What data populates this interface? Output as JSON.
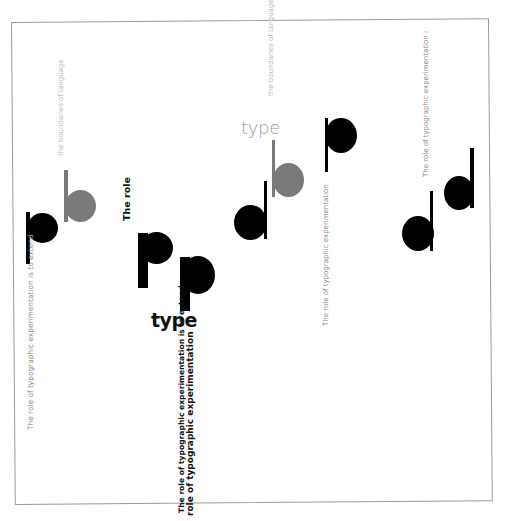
{
  "poster": {
    "texts": {
      "left_faint": "the boundaries of language",
      "left_vertical": "The role of typographic experimentation is to extend",
      "the_role_bold": "The role",
      "type_bold": "type",
      "bottom_line1": "The role of typographic experimentation is to extend",
      "bottom_line2": "role of typographic experimentation",
      "type_light": "type",
      "top_center_faint": "the boundaries of language",
      "mid_right_vertical": "The role of typographic experimentation",
      "right_vertical": "The role of typographic experimentation i"
    },
    "glyphs": [
      {
        "letter": "p",
        "color": "black",
        "position": "left"
      },
      {
        "letter": "b",
        "color": "gray",
        "position": "left"
      },
      {
        "letter": "p",
        "color": "black",
        "position": "center-left-large-1"
      },
      {
        "letter": "p",
        "color": "black",
        "position": "center-left-large-2"
      },
      {
        "letter": "b",
        "color": "gray",
        "position": "center"
      },
      {
        "letter": "d",
        "color": "black",
        "position": "center"
      },
      {
        "letter": "p",
        "color": "black",
        "position": "center-right"
      },
      {
        "letter": "d",
        "color": "black",
        "position": "right-1"
      },
      {
        "letter": "d",
        "color": "black",
        "position": "right-2"
      }
    ],
    "colors": {
      "black": "#000000",
      "gray": "#7a7a7a",
      "faint_text": "#b9b9b9",
      "border": "#9a9a9a"
    }
  }
}
